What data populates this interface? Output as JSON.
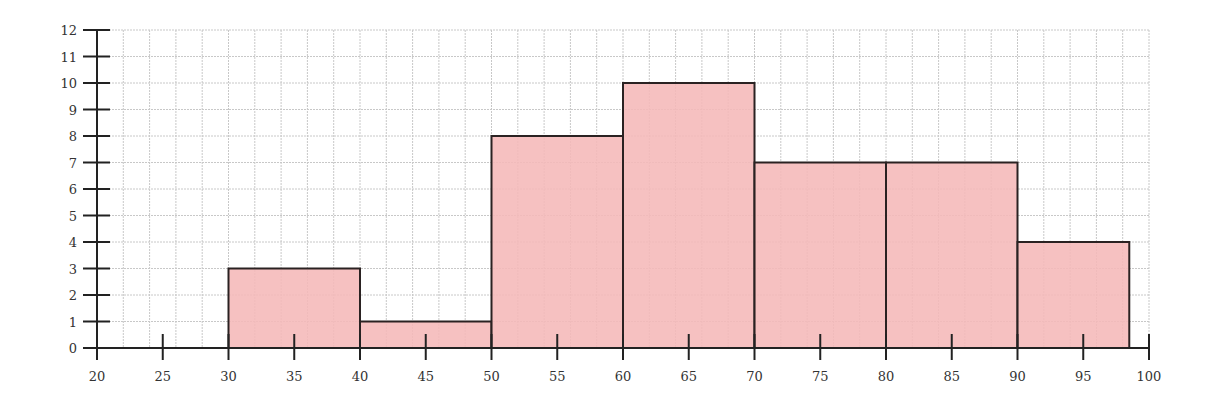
{
  "chart_data": {
    "type": "bar",
    "subtype": "histogram",
    "title": "",
    "xlabel": "",
    "ylabel": "",
    "xlim": [
      20,
      100
    ],
    "ylim": [
      0,
      12
    ],
    "grid": true,
    "legend": null,
    "x_ticks": [
      20,
      25,
      30,
      35,
      40,
      45,
      50,
      55,
      60,
      65,
      70,
      75,
      80,
      85,
      90,
      95,
      100
    ],
    "y_ticks": [
      0,
      1,
      2,
      3,
      4,
      5,
      6,
      7,
      8,
      9,
      10,
      11,
      12
    ],
    "bins": [
      {
        "start": 30,
        "end": 40,
        "count": 3
      },
      {
        "start": 40,
        "end": 50,
        "count": 1
      },
      {
        "start": 50,
        "end": 60,
        "count": 8
      },
      {
        "start": 60,
        "end": 70,
        "count": 10
      },
      {
        "start": 70,
        "end": 80,
        "count": 7
      },
      {
        "start": 80,
        "end": 90,
        "count": 7
      },
      {
        "start": 90,
        "end": 98.5,
        "count": 4
      }
    ],
    "categories": [
      "30-40",
      "40-50",
      "50-60",
      "60-70",
      "70-80",
      "80-90",
      "90-98.5"
    ],
    "values": [
      3,
      1,
      8,
      10,
      7,
      7,
      4
    ],
    "colors": {
      "bar_fill": "#f5b8b8",
      "bar_stroke": "#2a2222",
      "grid": "#c8c8c8",
      "axis": "#222222"
    }
  }
}
